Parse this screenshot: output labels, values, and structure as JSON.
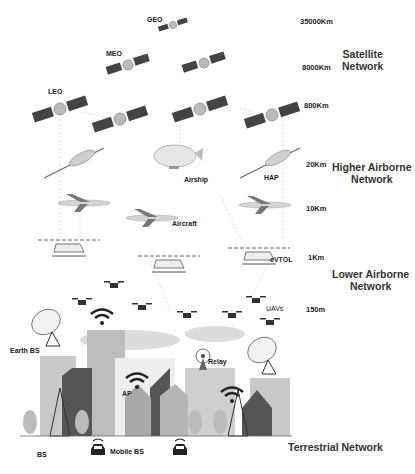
{
  "layers": [
    {
      "name": "Satellite Network",
      "line1": "Satellite",
      "line2": "Network"
    },
    {
      "name": "Higher Airborne Network",
      "line1": "Higher Airborne",
      "line2": "Network"
    },
    {
      "name": "Lower Airborne Network",
      "line1": "Lower Airborne",
      "line2": "Network"
    },
    {
      "name": "Terrestrial Network",
      "line1": "Terrestrial Network"
    }
  ],
  "altitudes": {
    "geo": "35000Km",
    "meo": "8000Km",
    "leo": "800Km",
    "hap": "20Km",
    "aircraft": "10Km",
    "evtol": "1Km",
    "uav": "150m"
  },
  "labels": {
    "geo": "GEO",
    "meo": "MEO",
    "leo": "LEO",
    "airship": "Airship",
    "hap": "HAP",
    "aircraft": "Aircraft",
    "evtol": "eVTOL",
    "uavs": "UAVs",
    "earth_bs": "Earth BS",
    "relay": "Relay",
    "ap": "AP",
    "bs": "BS",
    "mobile_bs": "Mobile BS"
  },
  "colors": {
    "building_light": "#c9c9c9",
    "building_mid": "#a9a9a9",
    "building_dark": "#555555",
    "cloud": "#dcdcdc",
    "panel": "#444444"
  }
}
